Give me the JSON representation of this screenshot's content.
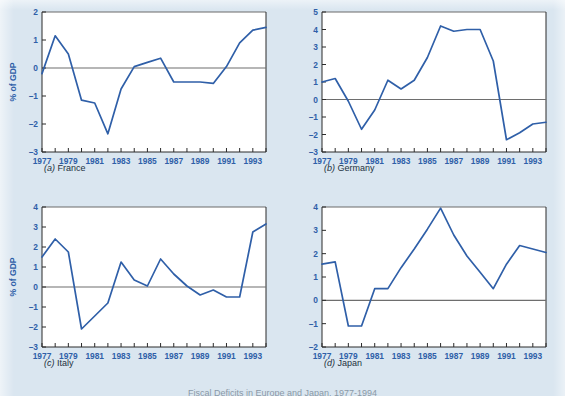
{
  "figure": {
    "background_color": "#dae6f0",
    "series_color": "#2f5fa8",
    "label_color": "#2f5fa8",
    "clipped_bottom_caption": "Fiscal Deficits in Europe and Japan, 1977-1994"
  },
  "panels": [
    {
      "key": "france",
      "caption_letter": "(a)",
      "caption_name": "France",
      "ylabel": "% of GDP"
    },
    {
      "key": "germany",
      "caption_letter": "(b)",
      "caption_name": "Germany",
      "ylabel": ""
    },
    {
      "key": "italy",
      "caption_letter": "(c)",
      "caption_name": "Italy",
      "ylabel": "% of GDP"
    },
    {
      "key": "japan",
      "caption_letter": "(d)",
      "caption_name": "Japan",
      "ylabel": ""
    }
  ],
  "chart_data": [
    {
      "type": "line",
      "title": "(a) France",
      "xlabel": "",
      "ylabel": "% of GDP",
      "xlim": [
        1977,
        1994
      ],
      "ylim": [
        -3,
        2
      ],
      "yticks": [
        -3,
        -2,
        -1,
        0,
        1,
        2
      ],
      "xticks": [
        1977,
        1979,
        1981,
        1983,
        1985,
        1987,
        1989,
        1991,
        1993
      ],
      "xtick_labels": [
        "1977",
        "1979",
        "1981",
        "1983",
        "1985",
        "1987",
        "1989",
        "1991",
        "1993"
      ],
      "grid": false,
      "legend": "none",
      "x": [
        1977,
        1978,
        1979,
        1980,
        1981,
        1982,
        1983,
        1984,
        1985,
        1986,
        1987,
        1988,
        1989,
        1990,
        1991,
        1992,
        1993,
        1994
      ],
      "values": [
        -0.2,
        1.15,
        0.5,
        -1.15,
        -1.25,
        -2.35,
        -0.75,
        0.05,
        0.2,
        0.35,
        -0.5,
        -0.5,
        -0.5,
        -0.55,
        0.05,
        0.9,
        1.35,
        1.45
      ]
    },
    {
      "type": "line",
      "title": "(b) Germany",
      "xlabel": "",
      "ylabel": "",
      "xlim": [
        1977,
        1994
      ],
      "ylim": [
        -3,
        5
      ],
      "yticks": [
        -3,
        -2,
        -1,
        0,
        1,
        2,
        3,
        4,
        5
      ],
      "xticks": [
        1977,
        1979,
        1981,
        1983,
        1985,
        1987,
        1989,
        1991,
        1993
      ],
      "xtick_labels": [
        "1977",
        "1979",
        "1981",
        "1983",
        "1985",
        "1987",
        "1989",
        "1991",
        "1993"
      ],
      "grid": false,
      "legend": "none",
      "x": [
        1977,
        1978,
        1979,
        1980,
        1981,
        1982,
        1983,
        1984,
        1985,
        1986,
        1987,
        1988,
        1989,
        1990,
        1991,
        1992,
        1993,
        1994
      ],
      "values": [
        1.0,
        1.2,
        -0.1,
        -1.7,
        -0.6,
        1.1,
        0.6,
        1.1,
        2.4,
        4.2,
        3.9,
        4.0,
        4.0,
        2.2,
        -2.3,
        -1.9,
        -1.4,
        -1.3
      ]
    },
    {
      "type": "line",
      "title": "(c) Italy",
      "xlabel": "",
      "ylabel": "% of GDP",
      "xlim": [
        1977,
        1994
      ],
      "ylim": [
        -3,
        4
      ],
      "yticks": [
        -3,
        -2,
        -1,
        0,
        1,
        2,
        3,
        4
      ],
      "xticks": [
        1977,
        1979,
        1981,
        1983,
        1985,
        1987,
        1989,
        1991,
        1993
      ],
      "xtick_labels": [
        "1977",
        "1979",
        "1981",
        "1983",
        "1985",
        "1987",
        "1989",
        "1991",
        "1993"
      ],
      "grid": false,
      "legend": "none",
      "x": [
        1977,
        1978,
        1979,
        1980,
        1981,
        1982,
        1983,
        1984,
        1985,
        1986,
        1987,
        1988,
        1989,
        1990,
        1991,
        1992,
        1993,
        1994
      ],
      "values": [
        1.5,
        2.4,
        1.75,
        -2.1,
        -1.45,
        -0.8,
        1.25,
        0.35,
        0.05,
        1.4,
        0.65,
        0.05,
        -0.4,
        -0.15,
        -0.5,
        -0.5,
        2.75,
        3.15
      ]
    },
    {
      "type": "line",
      "title": "(d) Japan",
      "xlabel": "",
      "ylabel": "",
      "xlim": [
        1977,
        1994
      ],
      "ylim": [
        -2,
        4
      ],
      "yticks": [
        -2,
        -1,
        0,
        1,
        2,
        3,
        4
      ],
      "xticks": [
        1977,
        1979,
        1981,
        1983,
        1985,
        1987,
        1989,
        1991,
        1993
      ],
      "xtick_labels": [
        "1977",
        "1979",
        "1981",
        "1983",
        "1985",
        "1987",
        "1989",
        "1991",
        "1993"
      ],
      "grid": false,
      "legend": "none",
      "x": [
        1977,
        1978,
        1979,
        1980,
        1981,
        1982,
        1983,
        1984,
        1985,
        1986,
        1987,
        1988,
        1989,
        1990,
        1991,
        1992,
        1993,
        1994
      ],
      "values": [
        1.55,
        1.65,
        -1.1,
        -1.1,
        0.5,
        0.5,
        1.4,
        2.2,
        3.05,
        3.95,
        2.8,
        1.9,
        1.2,
        0.5,
        1.55,
        2.35,
        2.2,
        2.05
      ]
    }
  ]
}
